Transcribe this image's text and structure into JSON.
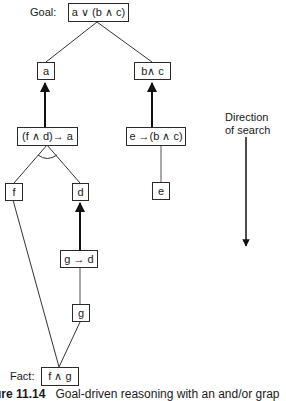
{
  "diagram": {
    "type": "and-or-graph",
    "goal_label": "Goal:",
    "fact_label": "Fact:",
    "direction_label_line1": "Direction",
    "direction_label_line2": "of search",
    "nodes": {
      "goal": "a ∨ (b ∧ c)",
      "a": "a",
      "b_and_c": "b∧ c",
      "rule_fd_a": "(f ∧ d)→ a",
      "rule_e_bc": "e →(b ∧ c)",
      "f": "f",
      "d": "d",
      "e": "e",
      "rule_g_d": "g → d",
      "g": "g",
      "fact": "f ∧ g"
    },
    "edges": [
      {
        "from": "goal",
        "to": "a",
        "style": "line"
      },
      {
        "from": "goal",
        "to": "b_and_c",
        "style": "line"
      },
      {
        "from": "rule_fd_a",
        "to": "a",
        "style": "arrow"
      },
      {
        "from": "rule_e_bc",
        "to": "b_and_c",
        "style": "arrow"
      },
      {
        "from": "rule_fd_a",
        "to": "f",
        "style": "and-line"
      },
      {
        "from": "rule_fd_a",
        "to": "d",
        "style": "and-line"
      },
      {
        "from": "rule_e_bc",
        "to": "e",
        "style": "line"
      },
      {
        "from": "rule_g_d",
        "to": "d",
        "style": "arrow"
      },
      {
        "from": "rule_g_d",
        "to": "g",
        "style": "line"
      },
      {
        "from": "f",
        "to": "fact",
        "style": "line"
      },
      {
        "from": "g",
        "to": "fact",
        "style": "line"
      }
    ]
  },
  "caption": {
    "figure_number": "ure 11.14",
    "text": "Goal-driven reasoning with an and/or grap"
  }
}
